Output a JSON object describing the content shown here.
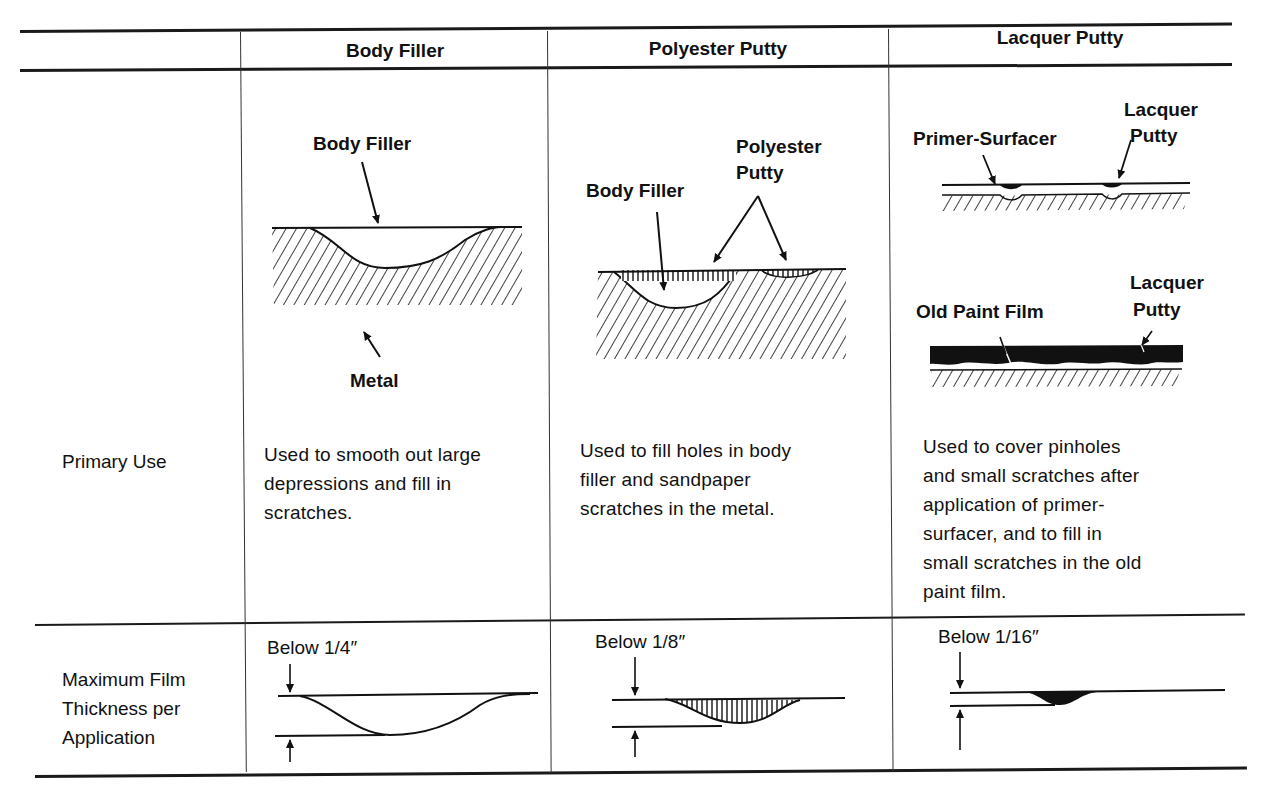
{
  "table": {
    "columns": [
      "Body Filler",
      "Polyester Putty",
      "Lacquer Putty"
    ],
    "rows": [
      {
        "label": "Primary Use",
        "cells": [
          "Used to smooth out large depressions and fill in scratches.",
          "Used to fill holes in body filler and sandpaper scratches in the metal.",
          "Used to cover pinholes and small scratches after application of primer-surfacer, and to fill in small scratches in the old paint film."
        ]
      },
      {
        "label": "Maximum Film Thickness per Application",
        "cells": [
          "Below 1/4″",
          "Below 1/8″",
          "Below 1/16″"
        ]
      }
    ]
  },
  "diagrams": {
    "body_filler": {
      "top_label": "Body Filler",
      "bottom_label": "Metal"
    },
    "polyester_putty": {
      "label_left": "Body Filler",
      "label_right_line1": "Polyester",
      "label_right_line2": "Putty"
    },
    "lacquer_putty": {
      "top_left_label": "Primer-Surfacer",
      "top_right_line1": "Lacquer",
      "top_right_line2": "Putty",
      "bottom_left_label": "Old Paint Film",
      "bottom_right_line1": "Lacquer",
      "bottom_right_line2": "Putty"
    }
  },
  "row_label_lines": {
    "max_film": [
      "Maximum Film",
      "Thickness per",
      "Application"
    ]
  },
  "desc_lines": {
    "body_filler": [
      "Used to smooth out large",
      "depressions and fill in",
      "scratches."
    ],
    "polyester_putty": [
      "Used to fill holes in body",
      "filler and sandpaper",
      "scratches in the metal."
    ],
    "lacquer_putty": [
      "Used to cover pinholes",
      "and small scratches after",
      "application of primer-",
      "surfacer, and to fill in",
      "small scratches in the old",
      "paint film."
    ]
  }
}
